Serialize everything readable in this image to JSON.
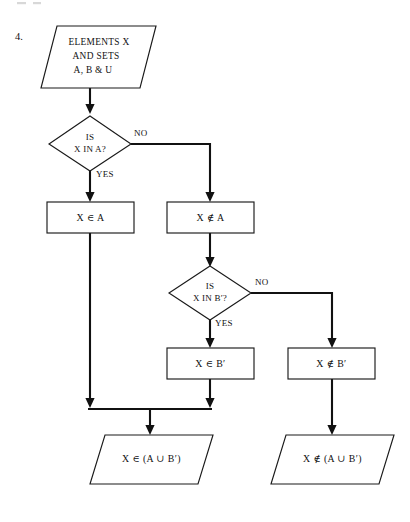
{
  "page": {
    "question_number": "4.",
    "background_color": "#ffffff",
    "ink_color": "#111111",
    "width": 410,
    "height": 522
  },
  "flowchart": {
    "title": "Set membership decision flowchart for A union B prime",
    "nodes": [
      {
        "id": "input-elements",
        "type": "input-parallelogram",
        "lines": [
          "ELEMENTS X",
          "AND SETS",
          "A, B & U"
        ]
      },
      {
        "id": "decision-x-in-a",
        "type": "decision-diamond",
        "lines": [
          "IS",
          "X IN A?"
        ]
      },
      {
        "id": "process-x-in-a",
        "type": "process-box",
        "lines": [
          "X ∈ A"
        ]
      },
      {
        "id": "process-x-not-in-a",
        "type": "process-box",
        "lines": [
          "X ∉ A"
        ]
      },
      {
        "id": "decision-x-in-bprime",
        "type": "decision-diamond",
        "lines": [
          "IS",
          "X IN B′?"
        ]
      },
      {
        "id": "process-x-in-bprime",
        "type": "process-box",
        "lines": [
          "X ∈ B′"
        ]
      },
      {
        "id": "process-x-not-in-bprime",
        "type": "process-box",
        "lines": [
          "X ∉ B′"
        ]
      },
      {
        "id": "output-in-union",
        "type": "output-parallelogram",
        "lines": [
          "X ∈ (A ∪ B′)"
        ]
      },
      {
        "id": "output-not-in-union",
        "type": "output-parallelogram",
        "lines": [
          "X ∉ (A ∪ B′)"
        ]
      }
    ],
    "edge_labels": {
      "a_yes": "YES",
      "a_no": "NO",
      "b_yes": "YES",
      "b_no": "NO"
    }
  }
}
